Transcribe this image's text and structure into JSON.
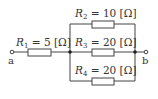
{
  "diagram": {
    "type": "circuit",
    "terminals": [
      {
        "id": "a",
        "label": "a"
      },
      {
        "id": "b",
        "label": "b"
      }
    ],
    "resistors": [
      {
        "id": "R1",
        "symbol": "R",
        "subscript": "1",
        "value": "5",
        "unit": "[Ω]",
        "position": "series"
      },
      {
        "id": "R2",
        "symbol": "R",
        "subscript": "2",
        "value": "10",
        "unit": "[Ω]",
        "position": "parallel-top"
      },
      {
        "id": "R3",
        "symbol": "R",
        "subscript": "3",
        "value": "20",
        "unit": "[Ω]",
        "position": "parallel-middle"
      },
      {
        "id": "R4",
        "symbol": "R",
        "subscript": "4",
        "value": "20",
        "unit": "[Ω]",
        "position": "parallel-bottom"
      }
    ],
    "equals": "=",
    "colors": {
      "line": "#444444",
      "text": "#333333",
      "background": "#ffffff"
    }
  }
}
